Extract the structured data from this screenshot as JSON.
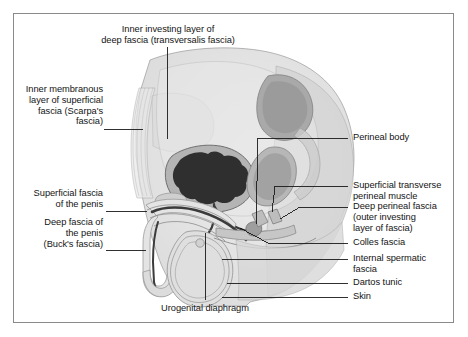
{
  "figure": {
    "frame_color": "#8a8a8a",
    "background": "#ffffff",
    "leader_line_color": "#1a1a1a",
    "illustration": {
      "style": "grayscale medical line drawing, sagittal section",
      "tones": {
        "body_fill": "#e2e2e2",
        "mid_tone": "#c9c9c9",
        "dark_tone": "#9a9a9a",
        "bladder": "#2f2f2f",
        "outline": "#6f6f6f"
      }
    }
  },
  "labels": {
    "top": [
      {
        "name": "inner-investing-layer-deep-fascia",
        "lines": [
          "Inner investing layer of",
          "deep fascia (transversalis fascia)"
        ],
        "align": "center"
      }
    ],
    "left": [
      {
        "name": "inner-membranous-layer-superficial-fascia",
        "lines": [
          "Inner membranous",
          "layer of superficial",
          "fascia (Scarpa's",
          "fascia)"
        ],
        "align": "right"
      },
      {
        "name": "superficial-fascia-of-penis",
        "lines": [
          "Superficial fascia",
          "of the penis"
        ],
        "align": "right"
      },
      {
        "name": "deep-fascia-of-penis",
        "lines": [
          "Deep fascia of",
          "the penis",
          "(Buck's fascia)"
        ],
        "align": "right"
      }
    ],
    "right": [
      {
        "name": "perineal-body",
        "lines": [
          "Perineal body"
        ],
        "align": "left"
      },
      {
        "name": "superficial-transverse-perineal-muscle",
        "lines": [
          "Superficial transverse",
          "perineal muscle"
        ],
        "align": "left"
      },
      {
        "name": "deep-perineal-fascia",
        "lines": [
          "Deep perineal fascia",
          "(outer investing",
          "layer of fascia)"
        ],
        "align": "left"
      },
      {
        "name": "colles-fascia",
        "lines": [
          "Colles fascia"
        ],
        "align": "left"
      },
      {
        "name": "internal-spermatic-fascia",
        "lines": [
          "Internal spermatic",
          "fascia"
        ],
        "align": "left"
      },
      {
        "name": "dartos-tunic",
        "lines": [
          "Dartos tunic"
        ],
        "align": "left"
      },
      {
        "name": "skin",
        "lines": [
          "Skin"
        ],
        "align": "left"
      }
    ],
    "bottom": [
      {
        "name": "urogenital-diaphragm",
        "lines": [
          "Urogenital diaphragm"
        ],
        "align": "center"
      }
    ]
  },
  "text": {
    "t0l0": "Inner investing layer of",
    "t0l1": "deep fascia (transversalis fascia)",
    "l0l0": "Inner membranous",
    "l0l1": "layer of superficial",
    "l0l2": "fascia (Scarpa's",
    "l0l3": "fascia)",
    "l1l0": "Superficial fascia",
    "l1l1": "of the penis",
    "l2l0": "Deep fascia of",
    "l2l1": "the penis",
    "l2l2": "(Buck's fascia)",
    "r0l0": "Perineal body",
    "r1l0": "Superficial transverse",
    "r1l1": "perineal muscle",
    "r2l0": "Deep perineal fascia",
    "r2l1": "(outer investing",
    "r2l2": "layer of fascia)",
    "r3l0": "Colles fascia",
    "r4l0": "Internal spermatic",
    "r4l1": "fascia",
    "r5l0": "Dartos tunic",
    "r6l0": "Skin",
    "b0l0": "Urogenital diaphragm"
  }
}
